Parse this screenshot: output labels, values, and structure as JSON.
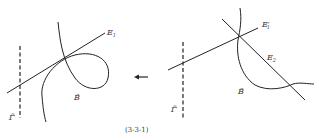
{
  "figure": {
    "caption": "(3-3-1)",
    "left_panel": {
      "line_label": "E",
      "line_sub": "1",
      "curve_label": "B̃",
      "dashed_label": "Γ̃"
    },
    "right_panel": {
      "line1_label": "E",
      "line1_sub": "1",
      "line1_prime": "′",
      "line2_label": "E",
      "line2_sub": "2",
      "curve_label": "B̃",
      "dashed_label": "Γ̃"
    },
    "arrow": "←",
    "colors": {
      "stroke": "#222222",
      "text": "#333333"
    }
  }
}
